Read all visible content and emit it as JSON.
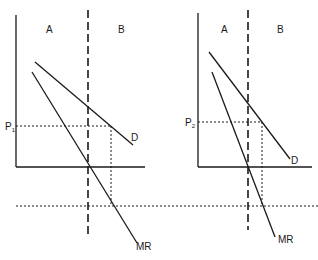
{
  "diagram": {
    "left_panel": {
      "region_a_label": "A",
      "region_b_label": "B",
      "price_label": "P",
      "price_subscript": "1",
      "demand_label": "D",
      "mr_label": "MR"
    },
    "right_panel": {
      "region_a_label": "A",
      "region_b_label": "B",
      "price_label": "P",
      "price_subscript": "2",
      "demand_label": "D",
      "mr_label": "MR"
    },
    "colors": {
      "ink": "#1a1a1a",
      "background": "#ffffff"
    }
  }
}
